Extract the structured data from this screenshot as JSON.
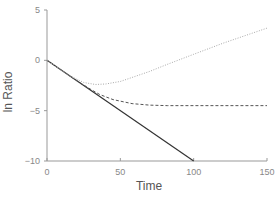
{
  "chart_data": {
    "type": "line",
    "title": "",
    "xlabel": "Time",
    "ylabel": "ln Ratio",
    "xlim": [
      0,
      150
    ],
    "ylim": [
      -10,
      5
    ],
    "xticks": [
      0,
      50,
      100,
      150
    ],
    "yticks": [
      -10,
      -5,
      0,
      5
    ],
    "xtick_labels": [
      "0",
      "50",
      "100",
      "150"
    ],
    "ytick_labels": [
      "−10",
      "−5",
      "0",
      "5"
    ],
    "grid": false,
    "legend": null,
    "series": [
      {
        "name": "solid",
        "style": "solid",
        "color": "#333333",
        "x": [
          0,
          100
        ],
        "y": [
          0,
          -10
        ]
      },
      {
        "name": "dashed",
        "style": "dashed",
        "color": "#555555",
        "x": [
          0,
          20,
          30,
          36,
          45,
          58,
          70,
          82,
          100,
          120,
          150
        ],
        "y": [
          0,
          -2.0,
          -2.9,
          -3.4,
          -3.9,
          -4.3,
          -4.45,
          -4.5,
          -4.5,
          -4.5,
          -4.5
        ]
      },
      {
        "name": "dotted",
        "style": "dotted",
        "color": "#aaaaaa",
        "x": [
          0,
          15,
          25,
          33,
          40,
          50,
          58,
          70,
          82,
          100,
          120,
          150
        ],
        "y": [
          0,
          -1.5,
          -2.2,
          -2.4,
          -2.35,
          -2.1,
          -1.7,
          -1.1,
          -0.4,
          0.6,
          1.7,
          3.2
        ]
      }
    ]
  }
}
